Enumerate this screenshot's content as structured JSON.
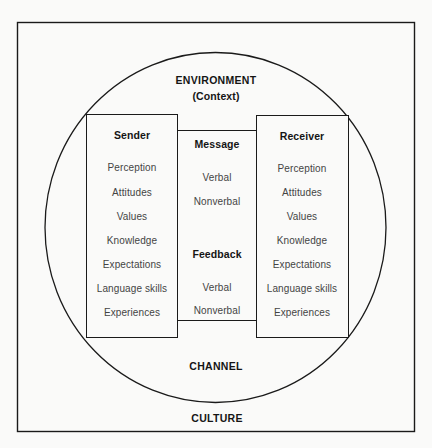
{
  "diagram": {
    "outer_frame_label": "CULTURE",
    "circle_labels": {
      "top_title": "ENVIRONMENT",
      "top_subtitle": "(Context)",
      "bottom_label": "CHANNEL"
    },
    "sender": {
      "title": "Sender",
      "items": [
        "Perception",
        "Attitudes",
        "Values",
        "Knowledge",
        "Expectations",
        "Language skills",
        "Experiences"
      ]
    },
    "receiver": {
      "title": "Receiver",
      "items": [
        "Perception",
        "Attitudes",
        "Values",
        "Knowledge",
        "Expectations",
        "Language skills",
        "Experiences"
      ]
    },
    "middle": {
      "message_title": "Message",
      "message_items": [
        "Verbal",
        "Nonverbal"
      ],
      "feedback_title": "Feedback",
      "feedback_items": [
        "Verbal",
        "Nonverbal"
      ]
    },
    "colors": {
      "line": "#1a1a1a",
      "background": "#fafaf9",
      "heading_text": "#151515",
      "item_text": "#444444"
    }
  }
}
